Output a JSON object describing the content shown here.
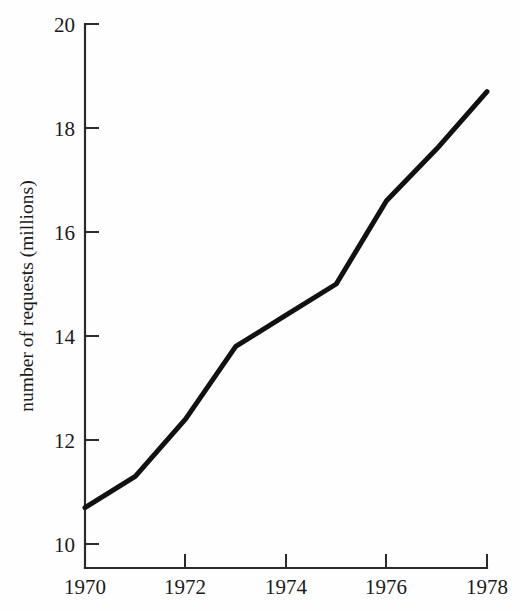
{
  "chart_data": {
    "type": "line",
    "title": "",
    "subtitle": "",
    "xlabel": "",
    "ylabel": "number of requests (millions)",
    "xlim": [
      1970,
      1978
    ],
    "ylim": [
      10,
      20
    ],
    "xticks": [
      1970,
      1972,
      1974,
      1976,
      1978
    ],
    "xtick_labels": [
      "1970",
      "1972",
      "1974",
      "1976",
      "1978"
    ],
    "yticks": [
      10,
      12,
      14,
      16,
      18,
      20
    ],
    "ytick_labels": [
      "10",
      "12",
      "14",
      "16",
      "18",
      "20"
    ],
    "grid": false,
    "legend": null,
    "legend_position": "none",
    "annotations": [],
    "line_color": "#111111",
    "axis_color": "#2b2b2b",
    "background_color": "#fefefe",
    "x": [
      1970,
      1971,
      1972,
      1973,
      1974,
      1975,
      1976,
      1977,
      1978
    ],
    "values": [
      10.7,
      11.3,
      12.4,
      13.8,
      14.4,
      15.0,
      16.6,
      17.6,
      18.7
    ],
    "series": [
      {
        "name": "number of requests",
        "x": [
          1970,
          1971,
          1972,
          1973,
          1974,
          1975,
          1976,
          1977,
          1978
        ],
        "values": [
          10.7,
          11.3,
          12.4,
          13.8,
          14.4,
          15.0,
          16.6,
          17.6,
          18.7
        ]
      }
    ]
  },
  "axes": {
    "y_axis_label": "number of requests (millions)",
    "y_tick_20": "20",
    "y_tick_18": "18",
    "y_tick_16": "16",
    "y_tick_14": "14",
    "y_tick_12": "12",
    "y_tick_10": "10",
    "x_tick_1970": "1970",
    "x_tick_1972": "1972",
    "x_tick_1974": "1974",
    "x_tick_1976": "1976",
    "x_tick_1978": "1978"
  }
}
